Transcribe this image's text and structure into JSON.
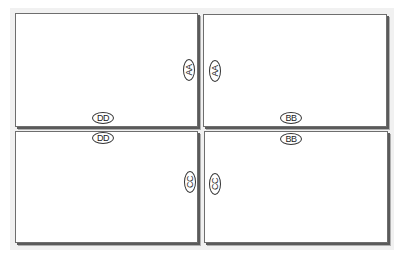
{
  "diagram": {
    "panels": [
      {
        "id": "top-left",
        "position": "top-left"
      },
      {
        "id": "top-right",
        "position": "top-right"
      },
      {
        "id": "bottom-left",
        "position": "bottom-left"
      },
      {
        "id": "bottom-right",
        "position": "bottom-right"
      }
    ],
    "labels": {
      "aa_left": "AA",
      "aa_right": "AA",
      "dd_top": "DD",
      "dd_bottom": "DD",
      "bb_top": "BB",
      "bb_bottom": "BB",
      "cc_left": "CC",
      "cc_right": "CC"
    },
    "colors": {
      "border": "#6e6e6e",
      "shadow": "#5a5a5a",
      "background_shade": "#f1f1f1",
      "panel_fill": "#ffffff"
    }
  }
}
